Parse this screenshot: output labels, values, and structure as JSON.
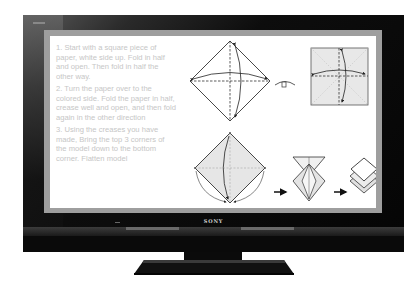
{
  "tv": {
    "brand": "SONY",
    "bezel_color": "#0a0a0a",
    "screen_border_color": "#9e9e9e"
  },
  "instructions": {
    "steps": [
      "1. Start with a square piece of paper, white side up. Fold in half and open. Then fold in half the other way.",
      "2. Turn the paper over to the colored side. Fold the paper in half, crease well and open, and then fold again in the other direction",
      "3. Using the creases you have made, Bring the top 3 corners of the model down to the bottom corner. Flatten model"
    ],
    "text_color": "#c6c6c6"
  },
  "diagrams": [
    {
      "id": "step1-diamond",
      "description": "white diamond with dashed crease lines and fold arrows"
    },
    {
      "id": "turn-over-symbol",
      "description": "turn-over symbol"
    },
    {
      "id": "step2-square",
      "description": "gray square with dashed creases and fold arrows"
    },
    {
      "id": "step3-diamond",
      "description": "gray diamond with corners folding to bottom"
    },
    {
      "id": "arrow-1",
      "description": "right arrow"
    },
    {
      "id": "step3-collapsing",
      "description": "partially collapsed model"
    },
    {
      "id": "arrow-2",
      "description": "right arrow"
    },
    {
      "id": "step3-result",
      "description": "flattened square base"
    }
  ]
}
